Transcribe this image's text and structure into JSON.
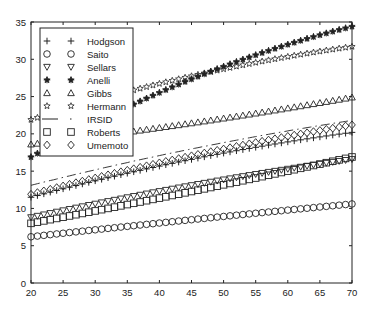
{
  "chart_data": {
    "type": "line",
    "title": "",
    "xlabel": "",
    "ylabel": "",
    "xlim": [
      20,
      70
    ],
    "ylim": [
      0,
      35
    ],
    "xticks": [
      20,
      25,
      30,
      35,
      40,
      45,
      50,
      55,
      60,
      65,
      70
    ],
    "yticks": [
      0,
      5,
      10,
      15,
      20,
      25,
      30,
      35
    ],
    "grid": false,
    "legend_position": "upper left",
    "x_step": 1,
    "series": [
      {
        "name": "Hodgson",
        "marker": "plus",
        "line": "none",
        "start": 11.5,
        "mid": 16.8,
        "end": 20.2
      },
      {
        "name": "Saito",
        "marker": "circle",
        "line": "none",
        "start": 6.2,
        "mid": 8.6,
        "end": 10.6
      },
      {
        "name": "Sellars",
        "marker": "triangle-down",
        "line": "none",
        "start": 8.8,
        "mid": 13.3,
        "end": 16.6
      },
      {
        "name": "Anelli",
        "marker": "star-filled",
        "line": "none",
        "start": 16.9,
        "mid": 27.8,
        "end": 34.4
      },
      {
        "name": "Gibbs",
        "marker": "triangle-up",
        "line": "none",
        "start": 18.6,
        "mid": 21.6,
        "end": 24.9
      },
      {
        "name": "Hermann",
        "marker": "star",
        "line": "none",
        "start": 21.9,
        "mid": 28.0,
        "end": 31.7
      },
      {
        "name": "IRSID",
        "marker": "none",
        "line": "dashdot",
        "start": 13.1,
        "mid": 18.2,
        "end": 21.8
      },
      {
        "name": "Roberts",
        "marker": "square",
        "line": "none",
        "start": 8.0,
        "mid": 12.5,
        "end": 16.9
      },
      {
        "name": "Umemoto",
        "marker": "diamond",
        "line": "none",
        "start": 11.9,
        "mid": 17.3,
        "end": 21.2
      }
    ]
  },
  "axes": {
    "x_tick_labels": [
      "20",
      "25",
      "30",
      "35",
      "40",
      "45",
      "50",
      "55",
      "60",
      "65",
      "70"
    ],
    "y_tick_labels": [
      "0",
      "5",
      "10",
      "15",
      "20",
      "25",
      "30",
      "35"
    ]
  },
  "legend": {
    "entries": [
      "Hodgson",
      "Saito",
      "Sellars",
      "Anelli",
      "Gibbs",
      "Hermann",
      "IRSID",
      "Roberts",
      "Umemoto"
    ]
  }
}
